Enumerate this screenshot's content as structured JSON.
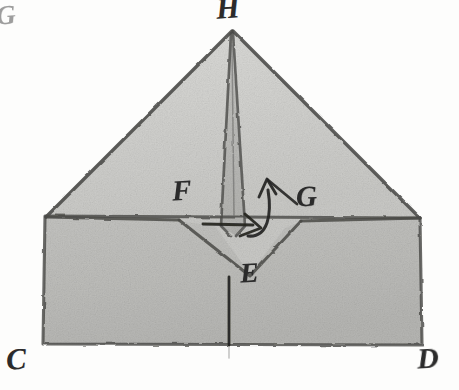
{
  "figure": {
    "background_color": "#fdfdfc",
    "ink_color": "#3a3a38",
    "colors": {
      "paper_background": "#fdfdfc",
      "triangle_fill": "#d2d2cf",
      "rectangle_fill": "#bdbdba",
      "spike_fill": "#b6b6b3",
      "notch_fill": "#c8c8c5",
      "ink": "#3a3a38",
      "label_ink": "#2b2b2b"
    },
    "labels": [
      {
        "id": "H",
        "text": "H",
        "role": "apex-vertex",
        "x": 229,
        "y": 8
      },
      {
        "id": "Gtop",
        "text": "G",
        "role": "partial-edge-label",
        "x": 4,
        "y": 14
      },
      {
        "id": "F",
        "text": "F",
        "role": "left-fold-point",
        "x": 186,
        "y": 190
      },
      {
        "id": "G",
        "text": "G",
        "role": "right-fold-point",
        "x": 310,
        "y": 196
      },
      {
        "id": "E",
        "text": "E",
        "role": "notch-vertex",
        "x": 253,
        "y": 273
      },
      {
        "id": "C",
        "text": "C",
        "role": "bottom-left-vertex",
        "x": 18,
        "y": 358
      },
      {
        "id": "D",
        "text": "D",
        "role": "bottom-right-vertex",
        "x": 429,
        "y": 357
      }
    ],
    "shapes": {
      "rectangle": {
        "name": "base-rectangle",
        "corners": [
          [
            45,
            216
          ],
          [
            420,
            218
          ],
          [
            422,
            345
          ],
          [
            43,
            344
          ]
        ]
      },
      "triangle": {
        "name": "folded-triangle",
        "corners": [
          [
            45,
            216
          ],
          [
            232,
            30
          ],
          [
            420,
            218
          ]
        ]
      },
      "spike": {
        "name": "central-spike",
        "points": [
          [
            231,
            32
          ],
          [
            244,
            228
          ],
          [
            236,
            236
          ],
          [
            222,
            228
          ]
        ]
      },
      "notch": {
        "name": "v-notch",
        "points": [
          [
            178,
            221
          ],
          [
            250,
            275
          ],
          [
            300,
            222
          ]
        ]
      }
    },
    "annotations": {
      "curved_arrow": {
        "name": "curl-arrow",
        "description": "curved arrow rising from fold line toward G"
      },
      "straight_arrow": {
        "name": "fold-direction-arrow",
        "description": "short horizontal arrow at the fold line pointing right"
      },
      "stem_line": {
        "name": "center-stem-line",
        "description": "vertical line descending from E through the rectangle"
      }
    }
  }
}
